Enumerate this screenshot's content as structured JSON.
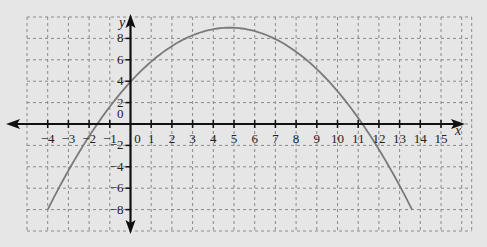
{
  "chart_data": {
    "type": "line",
    "title": "",
    "xlabel": "x",
    "ylabel": "y",
    "xlim": [
      -5,
      16
    ],
    "ylim": [
      -10,
      10
    ],
    "grid": true,
    "grid_style": "dashed",
    "x_ticks": [
      -4,
      -3,
      -2,
      -1,
      0,
      1,
      2,
      3,
      4,
      5,
      6,
      7,
      8,
      9,
      10,
      11,
      12,
      13,
      14,
      15
    ],
    "x_tick_labels": [
      "−4",
      "−3",
      "−2",
      "−1",
      "0",
      "1",
      "2",
      "3",
      "4",
      "5",
      "6",
      "7",
      "8",
      "9",
      "10",
      "11",
      "12",
      "13",
      "14",
      "15"
    ],
    "y_ticks": [
      -8,
      -6,
      -4,
      -2,
      0,
      2,
      4,
      6,
      8
    ],
    "y_tick_labels": [
      "−8",
      "−6",
      "−4",
      "−2",
      "0",
      "2",
      "4",
      "6",
      "8"
    ],
    "series": [
      {
        "name": "parabola",
        "description": "Downward-opening parabola, vertex approx (4.8, 9), y-intercept approx 4, x-intercepts approx -1.6 and 11.2",
        "color": "#7a7a7a",
        "x": [
          -4,
          -3,
          -2,
          -1,
          0,
          1,
          2,
          3,
          4,
          5,
          6,
          7,
          8,
          9,
          10,
          11,
          12,
          13,
          13.6
        ],
        "y": [
          -8.0,
          -4.35,
          -1.15,
          1.62,
          3.94,
          5.83,
          7.28,
          8.29,
          8.86,
          8.99,
          8.68,
          7.94,
          6.75,
          5.13,
          3.06,
          0.56,
          -2.38,
          -5.76,
          -8.0
        ]
      }
    ],
    "origin_label": "0"
  },
  "colors": {
    "background": "#e6e6e6",
    "grid": "#8a8a8a",
    "axes": "#111111",
    "curve": "#7a7a7a"
  }
}
